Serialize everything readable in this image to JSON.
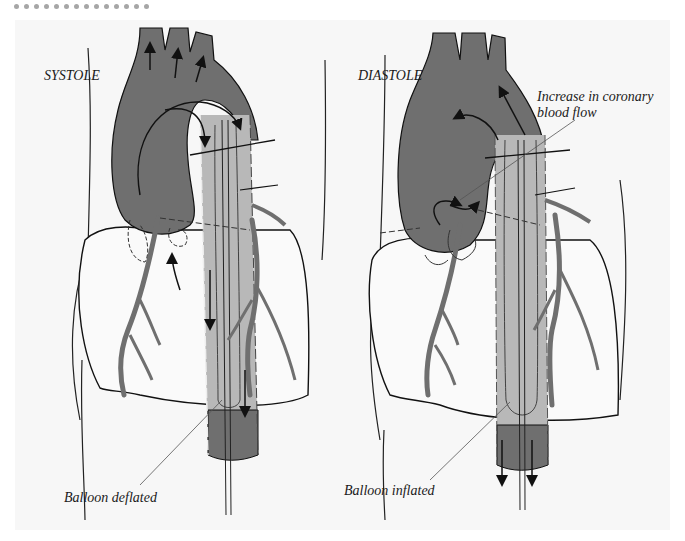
{
  "header": {
    "dot_count": 14
  },
  "figure": {
    "left_panel": {
      "title": "SYSTOLE",
      "callout": "Balloon deflated"
    },
    "right_panel": {
      "title": "DIASTOLE",
      "callout_top_line1": "Increase in coronary",
      "callout_top_line2": "blood flow",
      "callout_bottom": "Balloon inflated"
    },
    "colors": {
      "background": "#f7f7f7",
      "blood_fill": "#6f6f6f",
      "balloon_fill": "#b8b8b8",
      "outline": "#111111"
    }
  }
}
